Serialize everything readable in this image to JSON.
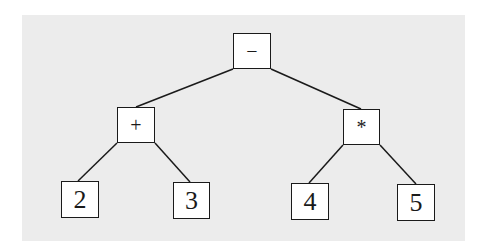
{
  "diagram": {
    "type": "expression-tree",
    "colors": {
      "background": "#ececec",
      "node_fill": "#ffffff",
      "stroke": "#1a1a1a"
    },
    "nodes": {
      "root": {
        "label": "−",
        "x": 233,
        "y": 33,
        "w": 38,
        "h": 36
      },
      "plus": {
        "label": "+",
        "x": 117,
        "y": 107,
        "w": 38,
        "h": 36
      },
      "times": {
        "label": "*",
        "x": 343,
        "y": 109,
        "w": 37,
        "h": 36
      },
      "two": {
        "label": "2",
        "x": 61,
        "y": 181,
        "w": 38,
        "h": 37
      },
      "three": {
        "label": "3",
        "x": 173,
        "y": 182,
        "w": 37,
        "h": 37
      },
      "four": {
        "label": "4",
        "x": 291,
        "y": 183,
        "w": 38,
        "h": 37
      },
      "five": {
        "label": "5",
        "x": 397,
        "y": 184,
        "w": 38,
        "h": 37
      }
    },
    "edges": [
      {
        "from": "root",
        "to": "plus"
      },
      {
        "from": "root",
        "to": "times"
      },
      {
        "from": "plus",
        "to": "two"
      },
      {
        "from": "plus",
        "to": "three"
      },
      {
        "from": "times",
        "to": "four"
      },
      {
        "from": "times",
        "to": "five"
      }
    ]
  }
}
